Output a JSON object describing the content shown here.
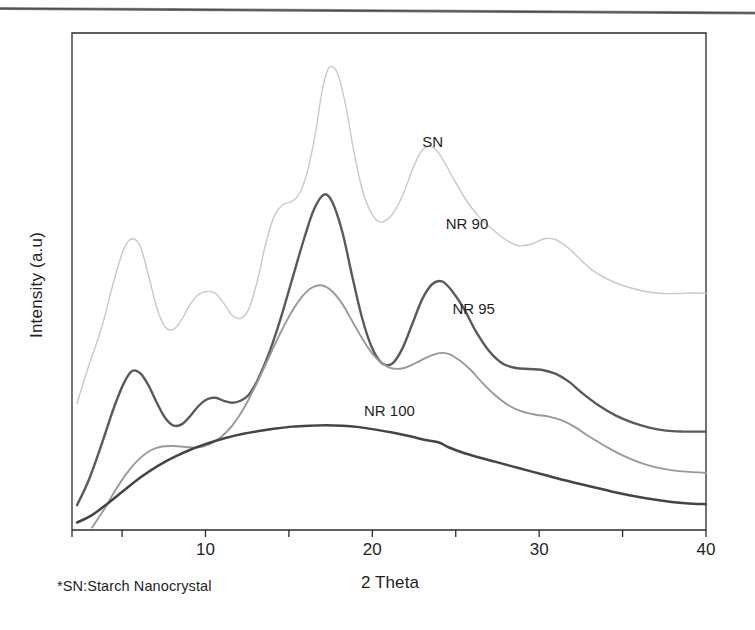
{
  "figure": {
    "kind": "xrd-diffractogram",
    "background": "#ffffff"
  },
  "axes": {
    "x_title": "2 Theta",
    "y_title": "Intensity (a.u)",
    "x_ticks_major": [
      "10",
      "20",
      "30",
      "40"
    ],
    "frame_color": "#2b2b2b"
  },
  "footnote": {
    "text": "*SN:Starch Nanocrystal"
  },
  "series_labels": {
    "sn": "SN",
    "nr90": "NR 90",
    "nr95": "NR 95",
    "nr100": "NR 100"
  },
  "chart_data": {
    "type": "line",
    "title": "",
    "subtitle": "",
    "xlabel": "2 Theta",
    "ylabel": "Intensity (a.u)",
    "xlim": [
      2,
      40
    ],
    "ylim": [
      0,
      100
    ],
    "grid": false,
    "legend_position": "inline-annotation",
    "xticks_major": [
      10,
      20,
      30,
      40
    ],
    "xticks_minor": [
      5,
      15,
      25,
      35
    ],
    "y_axis_ticks": false,
    "annotations": [
      {
        "text": "SN",
        "x": 23.0,
        "y": 78.0
      },
      {
        "text": "NR 90",
        "x": 24.4,
        "y": 61.5
      },
      {
        "text": "NR 95",
        "x": 24.8,
        "y": 44.5
      },
      {
        "text": "NR 100",
        "x": 19.5,
        "y": 24.0
      },
      {
        "text": "*SN:Starch Nanocrystal",
        "x": 3.5,
        "y": -16.0
      }
    ],
    "series": [
      {
        "name": "SN",
        "color": "#c9c9c9",
        "width": 1.4,
        "x": [
          2.3,
          3.0,
          3.8,
          4.5,
          5.1,
          5.6,
          6.1,
          6.6,
          7.1,
          7.6,
          8.1,
          8.6,
          9.1,
          9.6,
          10.1,
          10.6,
          11.1,
          11.6,
          12.1,
          12.6,
          13.1,
          13.6,
          14.1,
          14.6,
          15.1,
          15.6,
          16.1,
          16.6,
          17.0,
          17.4,
          17.9,
          18.4,
          18.9,
          19.4,
          19.9,
          20.4,
          20.9,
          21.4,
          21.9,
          22.4,
          22.9,
          23.4,
          23.9,
          24.4,
          24.9,
          25.6,
          26.4,
          27.2,
          28.0,
          28.8,
          29.6,
          30.3,
          31.0,
          31.8,
          32.6,
          33.4,
          34.4,
          35.4,
          36.4,
          37.4,
          38.4,
          39.2,
          40.0
        ],
        "y": [
          25.5,
          33.0,
          41.0,
          50.0,
          56.5,
          58.6,
          57.0,
          51.0,
          44.5,
          40.8,
          40.4,
          42.5,
          45.5,
          47.4,
          48.0,
          47.6,
          45.6,
          43.2,
          42.6,
          44.5,
          50.0,
          57.5,
          63.0,
          65.4,
          66.0,
          67.5,
          72.0,
          80.0,
          88.5,
          93.0,
          92.0,
          85.5,
          76.0,
          68.5,
          64.0,
          62.0,
          62.5,
          64.5,
          68.0,
          72.5,
          76.0,
          77.2,
          76.2,
          73.5,
          70.5,
          66.5,
          63.0,
          60.5,
          58.4,
          57.2,
          57.6,
          58.6,
          58.4,
          56.6,
          54.0,
          51.8,
          50.0,
          48.8,
          48.0,
          47.6,
          47.6,
          47.7,
          47.6
        ]
      },
      {
        "name": "NR 90",
        "color": "#5a5a5a",
        "width": 2.4,
        "x": [
          2.3,
          3.0,
          3.8,
          4.5,
          5.1,
          5.6,
          6.1,
          6.6,
          7.1,
          7.6,
          8.1,
          8.6,
          9.1,
          9.6,
          10.1,
          10.6,
          11.1,
          11.6,
          12.1,
          12.6,
          13.1,
          13.8,
          14.5,
          15.2,
          15.9,
          16.5,
          17.1,
          17.6,
          18.2,
          18.8,
          19.4,
          20.0,
          20.6,
          21.2,
          21.8,
          22.4,
          23.0,
          23.6,
          24.2,
          24.8,
          25.5,
          26.2,
          27.0,
          27.8,
          28.6,
          29.4,
          30.2,
          31.0,
          31.8,
          32.6,
          33.6,
          34.6,
          35.6,
          36.6,
          37.6,
          38.6,
          39.3,
          40.0
        ],
        "y": [
          5.0,
          10.0,
          17.5,
          24.5,
          29.5,
          32.0,
          31.5,
          29.0,
          25.5,
          22.5,
          21.0,
          21.3,
          23.0,
          25.0,
          26.3,
          26.6,
          26.0,
          25.6,
          26.0,
          27.2,
          30.0,
          35.5,
          42.5,
          50.5,
          58.5,
          64.5,
          67.5,
          66.0,
          60.0,
          51.0,
          42.5,
          36.5,
          33.5,
          33.5,
          36.5,
          41.5,
          46.5,
          49.5,
          50.0,
          48.0,
          44.5,
          40.0,
          36.0,
          33.5,
          32.6,
          32.4,
          32.2,
          31.4,
          29.8,
          27.5,
          25.0,
          23.0,
          21.6,
          20.6,
          20.0,
          19.8,
          19.8,
          19.8
        ]
      },
      {
        "name": "NR 95",
        "color": "#9a9a9a",
        "width": 1.9,
        "x": [
          3.2,
          3.9,
          4.6,
          5.3,
          6.0,
          6.7,
          7.4,
          8.1,
          8.8,
          9.5,
          10.2,
          10.9,
          11.6,
          12.3,
          13.0,
          13.7,
          14.4,
          15.1,
          15.8,
          16.4,
          17.0,
          17.6,
          18.2,
          18.8,
          19.4,
          20.0,
          20.6,
          21.2,
          21.9,
          22.6,
          23.3,
          24.0,
          24.6,
          25.2,
          25.9,
          26.6,
          27.4,
          28.2,
          29.0,
          29.8,
          30.6,
          31.4,
          32.2,
          33.0,
          34.0,
          35.0,
          36.0,
          37.0,
          38.0,
          39.0,
          40.0
        ],
        "y": [
          0.5,
          4.0,
          8.0,
          11.5,
          14.2,
          16.0,
          16.8,
          16.9,
          16.7,
          16.6,
          17.2,
          18.6,
          21.0,
          24.5,
          29.0,
          34.0,
          39.0,
          43.5,
          47.0,
          48.8,
          49.2,
          48.0,
          45.5,
          42.0,
          38.5,
          35.5,
          33.5,
          32.5,
          32.6,
          33.6,
          34.8,
          35.6,
          35.4,
          34.2,
          32.2,
          29.6,
          27.0,
          25.0,
          23.8,
          23.2,
          22.8,
          22.0,
          20.6,
          18.8,
          16.8,
          15.0,
          13.6,
          12.6,
          12.0,
          11.7,
          11.5
        ]
      },
      {
        "name": "NR 100",
        "color": "#454545",
        "width": 2.5,
        "x": [
          2.3,
          3.2,
          4.2,
          5.2,
          6.2,
          7.2,
          8.2,
          9.2,
          10.2,
          11.2,
          12.2,
          13.2,
          14.2,
          15.2,
          16.2,
          17.2,
          18.2,
          19.2,
          20.2,
          21.2,
          22.2,
          23.2,
          24.0,
          24.6,
          25.4,
          26.4,
          27.4,
          28.4,
          29.4,
          30.4,
          31.4,
          32.4,
          33.4,
          34.4,
          35.4,
          36.4,
          37.4,
          38.4,
          39.2,
          40.0
        ],
        "y": [
          1.5,
          3.0,
          5.5,
          8.2,
          10.8,
          13.0,
          14.8,
          16.3,
          17.5,
          18.5,
          19.3,
          19.9,
          20.4,
          20.8,
          21.0,
          21.1,
          21.0,
          20.7,
          20.2,
          19.6,
          18.9,
          18.1,
          17.6,
          16.6,
          15.6,
          14.6,
          13.7,
          12.8,
          11.9,
          11.0,
          10.1,
          9.3,
          8.5,
          7.7,
          7.0,
          6.4,
          5.9,
          5.5,
          5.3,
          5.2
        ]
      }
    ]
  }
}
